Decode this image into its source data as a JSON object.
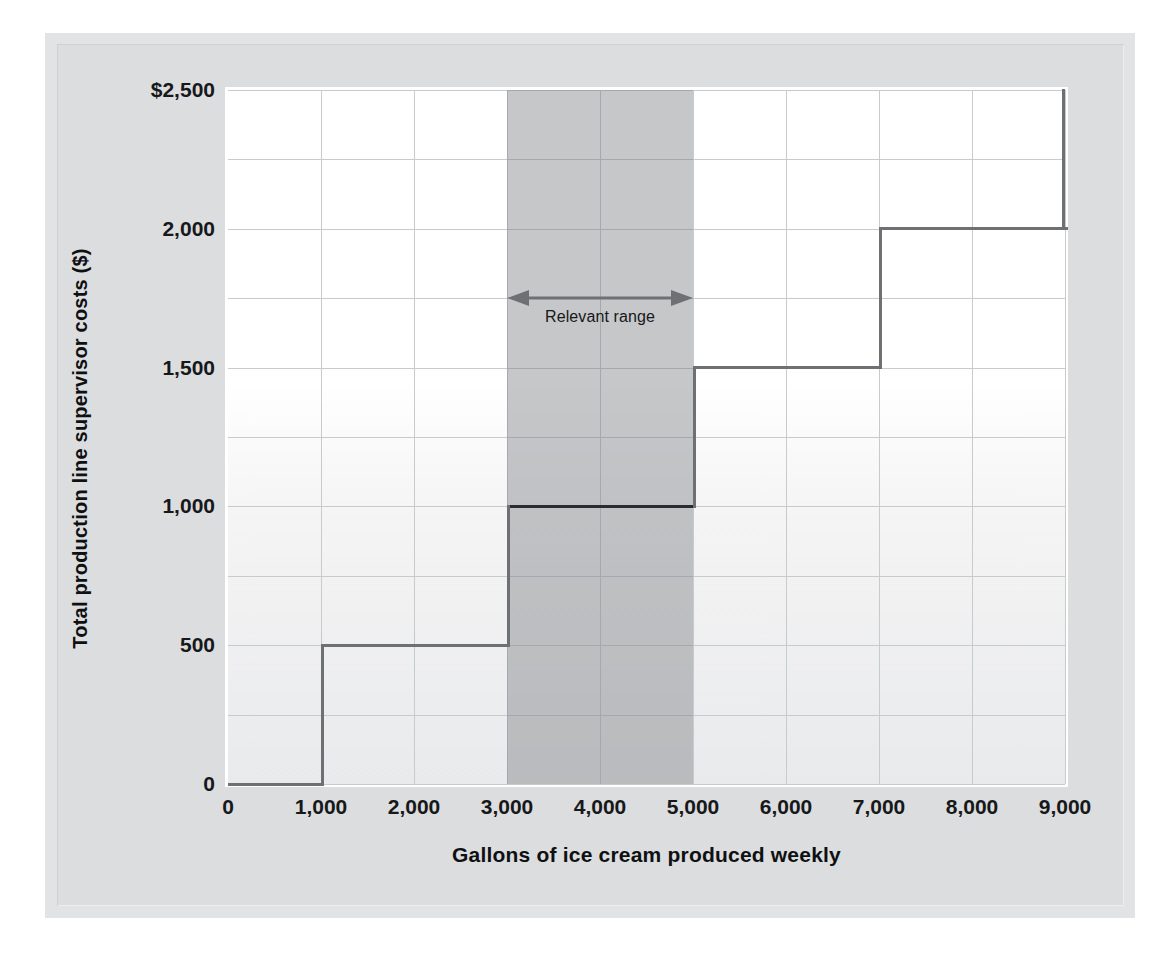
{
  "chart_data": {
    "type": "line",
    "subtype": "step",
    "title": "",
    "xlabel": "Gallons of ice cream produced weekly",
    "ylabel": "Total production line supervisor costs ($)",
    "xlim": [
      0,
      9000
    ],
    "ylim": [
      0,
      2500
    ],
    "xticks": [
      0,
      1000,
      2000,
      3000,
      4000,
      5000,
      6000,
      7000,
      8000,
      9000
    ],
    "xticklabels": [
      "0",
      "1,000",
      "2,000",
      "3,000",
      "4,000",
      "5,000",
      "6,000",
      "7,000",
      "8,000",
      "9,000"
    ],
    "yticks": [
      0,
      500,
      1000,
      1500,
      2000,
      2500
    ],
    "yticklabels": [
      "0",
      "500",
      "1,000",
      "1,500",
      "2,000",
      "$2,500"
    ],
    "grid": true,
    "grid_y_minor_step": 250,
    "legend": false,
    "series": [
      {
        "name": "Total production line supervisor costs",
        "steps": [
          {
            "x_start": 0,
            "x_end": 1000,
            "y": 0,
            "highlight": false
          },
          {
            "x_start": 1000,
            "x_end": 3000,
            "y": 500,
            "highlight": false
          },
          {
            "x_start": 3000,
            "x_end": 5000,
            "y": 1000,
            "highlight": true
          },
          {
            "x_start": 5000,
            "x_end": 7000,
            "y": 1500,
            "highlight": false
          },
          {
            "x_start": 7000,
            "x_end": 9000,
            "y": 2000,
            "highlight": false
          },
          {
            "x_start": 9000,
            "x_end": 9000,
            "y": 2500,
            "highlight": false
          }
        ]
      }
    ],
    "annotations": [
      {
        "label": "Relevant range",
        "type": "span-arrow",
        "x_start": 3000,
        "x_end": 5000,
        "y": 1750,
        "shaded_band": true
      }
    ],
    "colors": {
      "step_line": "#6e7074",
      "step_line_highlight": "#2b2c2e",
      "gridline": "#c9cacc",
      "band_shade": "#787a7e",
      "plot_background_top": "#ffffff",
      "plot_background_bottom": "#e9eaeb",
      "frame": "#e2e3e5",
      "text": "#17181a"
    }
  }
}
